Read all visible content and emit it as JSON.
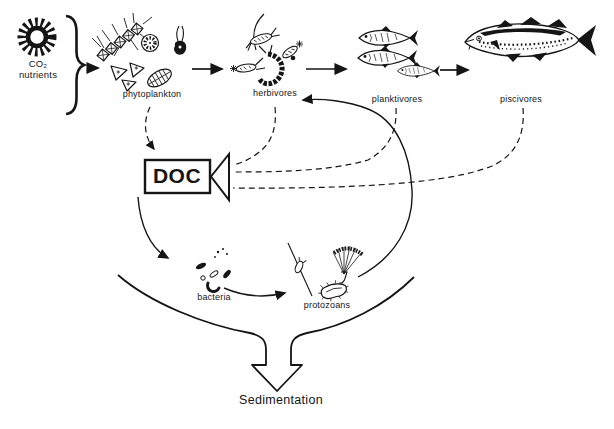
{
  "diagram": {
    "background": "#ffffff",
    "ink": "#151515",
    "labels": {
      "inputs_line1": "CO₂",
      "inputs_line2": "nutrients",
      "phytoplankton": "phytoplankton",
      "herbivores": "herbivores",
      "planktivores": "planktivores",
      "piscivores": "piscivores",
      "doc": "DOC",
      "bacteria": "bacteria",
      "protozoans": "protozoans",
      "sedimentation": "Sedimentation"
    },
    "flows": [
      {
        "from": "CO₂ nutrients",
        "to": "phytoplankton",
        "style": "solid-arrow"
      },
      {
        "from": "phytoplankton",
        "to": "herbivores",
        "style": "solid-arrow"
      },
      {
        "from": "herbivores",
        "to": "planktivores",
        "style": "solid-arrow"
      },
      {
        "from": "planktivores",
        "to": "piscivores",
        "style": "solid-arrow"
      },
      {
        "from": "phytoplankton",
        "to": "DOC",
        "style": "dashed-arrow"
      },
      {
        "from": "herbivores",
        "to": "DOC",
        "style": "dashed"
      },
      {
        "from": "planktivores",
        "to": "DOC",
        "style": "dashed"
      },
      {
        "from": "piscivores",
        "to": "DOC",
        "style": "dashed"
      },
      {
        "from": "DOC",
        "to": "bacteria",
        "style": "solid-arrow"
      },
      {
        "from": "bacteria",
        "to": "protozoans",
        "style": "solid-arrow"
      },
      {
        "from": "protozoans",
        "to": "herbivores",
        "style": "solid-arrow"
      },
      {
        "from": "microbial-loop",
        "to": "Sedimentation",
        "style": "hollow-block-arrow"
      }
    ]
  }
}
